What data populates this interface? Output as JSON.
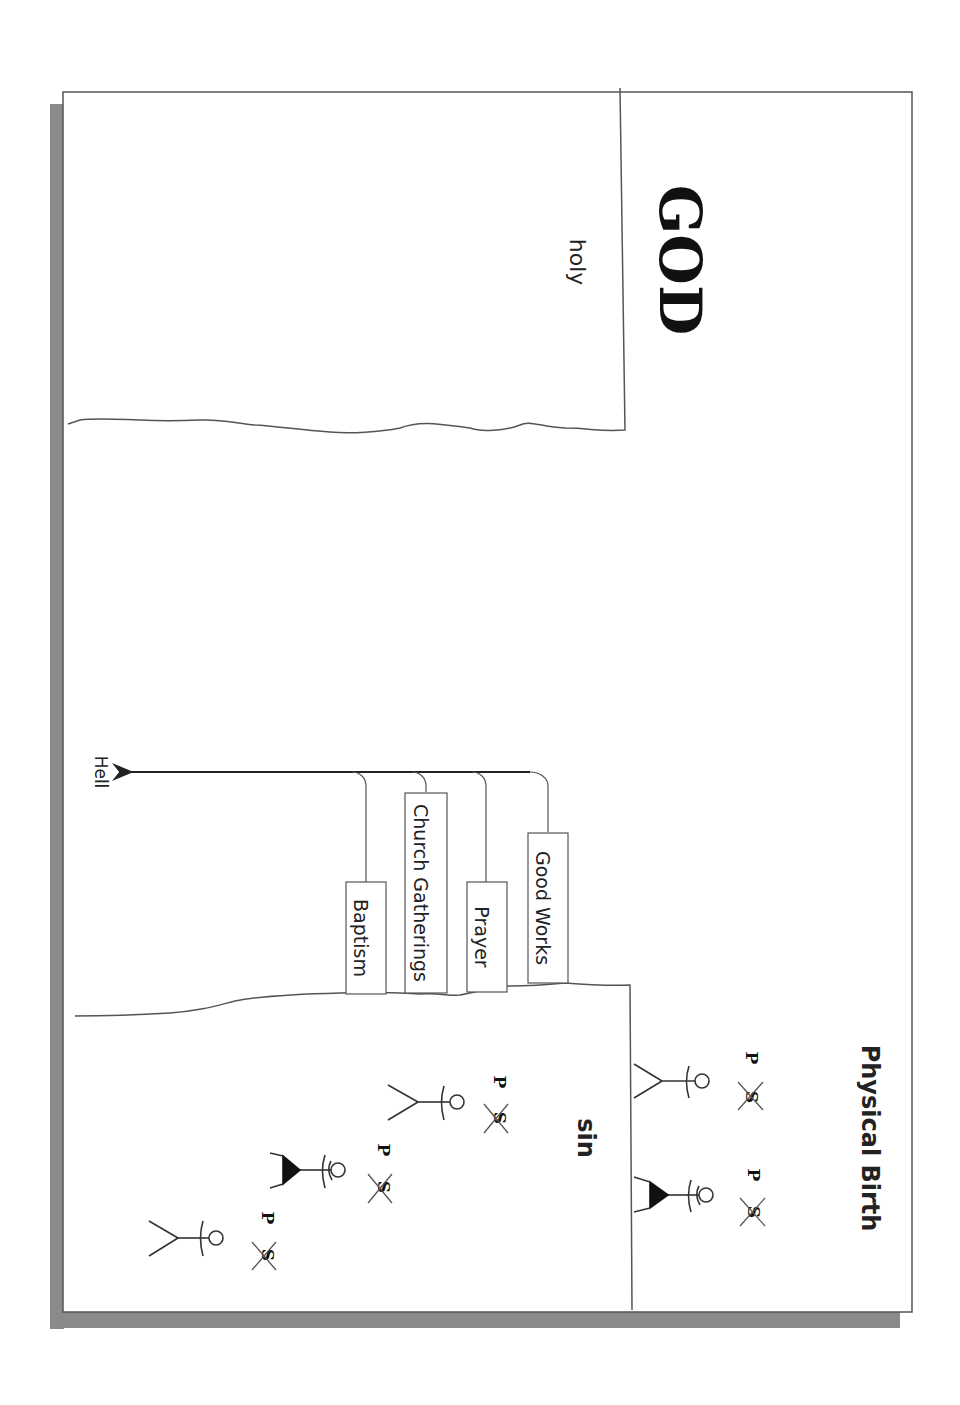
{
  "diagram": {
    "god_region": {
      "title": "GOD",
      "attribute": "holy"
    },
    "human_region": {
      "attribute": "sin",
      "birth_label": "Physical Birth"
    },
    "works": [
      {
        "label": "Good Works"
      },
      {
        "label": "Prayer"
      },
      {
        "label": "Church Gatherings"
      },
      {
        "label": "Baptism"
      }
    ],
    "destination": "Hell",
    "figure_marks": {
      "p": "P",
      "s": "S"
    },
    "colors": {
      "line": "#444444",
      "shadow": "#8a8a8a",
      "text": "#222222"
    }
  }
}
